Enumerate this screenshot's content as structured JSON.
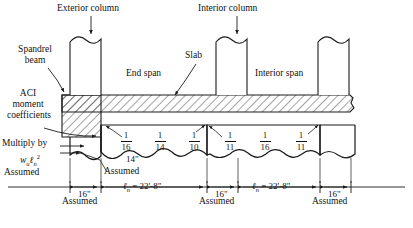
{
  "figure": {
    "title_top_left": "Exterior column",
    "title_top_right": "Interior column",
    "labels": {
      "spandrel_beam": "Spandrel\nbeam",
      "spandrel_line1": "Spandrel",
      "spandrel_line2": "beam",
      "aci_line1": "ACI",
      "aci_line2": "moment",
      "aci_line3": "coefficients",
      "slab": "Slab",
      "end_span": "End span",
      "interior_span": "Interior span",
      "multiply_by": "Multiply by",
      "multiply_expr_w": "w",
      "multiply_expr_wsub": "u",
      "multiply_expr_l": "ℓ",
      "multiply_expr_lsub": "n",
      "multiply_expr_lsup": "2",
      "exterior_column": "Exterior column",
      "interior_column": "Interior column"
    },
    "assumed_labels": [
      {
        "id": "assumed-left-of-multiply",
        "text": "Assumed"
      },
      {
        "id": "assumed-above-span",
        "text": "Assumed"
      },
      {
        "id": "assumed-below-col1",
        "text": "Assumed"
      },
      {
        "id": "assumed-below-col2",
        "text": "Assumed"
      },
      {
        "id": "assumed-below-col3",
        "text": "Assumed"
      }
    ],
    "coefficients": {
      "end_span": [
        "1/16",
        "1/14",
        "1/10"
      ],
      "interior_span": [
        "1/11",
        "1/16",
        "1/11"
      ],
      "end_span_fractions": [
        {
          "num": "1",
          "den": "16"
        },
        {
          "num": "1",
          "den": "14"
        },
        {
          "num": "1",
          "den": "10"
        }
      ],
      "interior_span_fractions": [
        {
          "num": "1",
          "den": "11"
        },
        {
          "num": "1",
          "den": "16"
        },
        {
          "num": "1",
          "den": "11"
        }
      ]
    },
    "dimensions": {
      "column_width_1": "16\"",
      "column_width_2": "16\"",
      "column_width_3": "16\"",
      "beam_depth_note": "14\"",
      "clear_span_1": "ℓn = 22'-8\"",
      "clear_span_2": "ℓn = 22'-8\"",
      "clear_span_symbol": "ℓ",
      "clear_span_sub": "n",
      "clear_span_value": "= 22'-8\""
    },
    "colors": {
      "line": "#1a1a1a",
      "hatch": "#333333",
      "background": "#ffffff"
    }
  }
}
